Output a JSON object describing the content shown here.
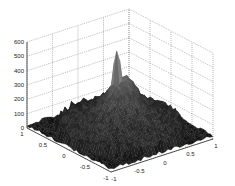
{
  "chart_data": {
    "type": "surface3d",
    "title": "",
    "xlabel": "",
    "ylabel": "",
    "zlabel": "",
    "x_range": [
      -1,
      1
    ],
    "y_range": [
      -1,
      1
    ],
    "zlim": [
      0,
      600
    ],
    "x_ticks": [
      "-1",
      "-0.5",
      "0",
      "0.5",
      "1"
    ],
    "y_ticks": [
      "-1",
      "-0.5",
      "0",
      "0.5",
      "1"
    ],
    "z_ticks": [
      "0",
      "100",
      "200",
      "300",
      "400",
      "500",
      "600"
    ],
    "grid": true,
    "colormap": "gray",
    "features": [
      {
        "name": "main-spike",
        "x": 0.1,
        "y": 0.2,
        "z": 550
      },
      {
        "name": "lobe-right",
        "x": 0.4,
        "y": 0.4,
        "z": 230
      },
      {
        "name": "lobe-center",
        "x": 0.2,
        "y": 0.3,
        "z": 200
      },
      {
        "name": "base-noise",
        "z_range": [
          0,
          150
        ]
      }
    ]
  }
}
